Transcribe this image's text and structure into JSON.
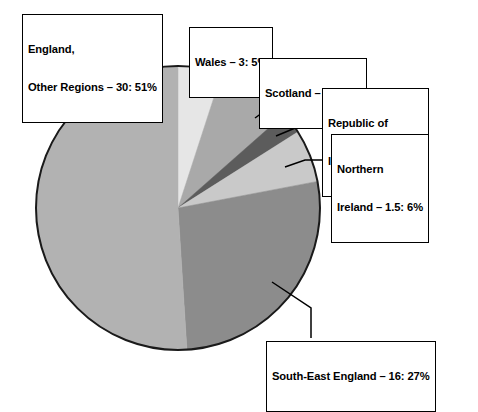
{
  "chart_data": {
    "type": "pie",
    "title": "",
    "subtitle": "",
    "xlabel": "",
    "ylabel": "",
    "grid": false,
    "legend_position": "callout-boxes",
    "value_unit": "",
    "center": {
      "x": 178,
      "y": 208
    },
    "radius": 142,
    "start_angle_deg": 0,
    "direction": "clockwise",
    "categories": [
      "Wales",
      "Scotland",
      "Republic of Ireland",
      "Northern Ireland",
      "South-East England",
      "England, Other Regions"
    ],
    "values": [
      3,
      5,
      3.6,
      1.5,
      16,
      30
    ],
    "percent_labels": [
      "5%",
      "8.5%",
      "2.5%",
      "6%",
      "27%",
      "51%"
    ],
    "slices": [
      {
        "name": "Wales",
        "label_text": "Wales – 3: 5%",
        "value": 3,
        "percent": 5,
        "sweep_deg": 18,
        "color": "#e6e6e6"
      },
      {
        "name": "Scotland",
        "label_text": "Scotland – 5: 8.5%",
        "value": 5,
        "percent": 8.5,
        "sweep_deg": 30.6,
        "color": "#a9a9a9"
      },
      {
        "name": "Republic of Ireland",
        "label_line_1": "Republic of",
        "label_line_2": "Ireland – 3.6: 2.5%",
        "value": 3.6,
        "percent": 2.5,
        "sweep_deg": 9,
        "color": "#5c5c5c"
      },
      {
        "name": "Northern Ireland",
        "label_line_1": "Northern",
        "label_line_2": "Ireland – 1.5: 6%",
        "value": 1.5,
        "percent": 6,
        "sweep_deg": 21.6,
        "color": "#c9c9c9"
      },
      {
        "name": "South-East England",
        "label_text": "South-East England – 16: 27%",
        "value": 16,
        "percent": 27,
        "sweep_deg": 97.2,
        "color": "#8c8c8c"
      },
      {
        "name": "England, Other Regions",
        "label_line_1": "England,",
        "label_line_2": "Other Regions – 30: 51%",
        "value": 30,
        "percent": 51,
        "sweep_deg": 183.6,
        "color": "#b2b2b2"
      }
    ],
    "colors": {
      "outline": "#1a1a1a",
      "background": "#ffffff",
      "label_border": "#000000",
      "label_text": "#000000",
      "leader_line": "#000000"
    }
  },
  "labels": {
    "england": {
      "line1": "England,",
      "line2": "Other Regions – 30: 51%"
    },
    "wales": {
      "line1": "Wales – 3: 5%"
    },
    "scotland": {
      "line1": "Scotland – 5: 8.5%"
    },
    "republic_of_ireland": {
      "line1": "Republic of",
      "line2": "Ireland – 3.6: 2.5%"
    },
    "northern_ireland": {
      "line1": "Northern",
      "line2": "Ireland – 1.5: 6%"
    },
    "south_east_england": {
      "line1": "South-East England – 16: 27%"
    }
  }
}
